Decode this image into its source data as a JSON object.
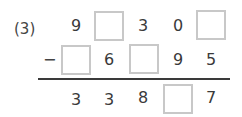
{
  "problem": {
    "label": "(3)",
    "operator": "−",
    "rows": [
      [
        "9",
        "",
        "3",
        "0",
        ""
      ],
      [
        "",
        "6",
        "",
        "9",
        "5"
      ],
      [
        "3",
        "3",
        "8",
        "",
        "7"
      ]
    ],
    "blank_cells": [
      [
        0,
        1
      ],
      [
        0,
        4
      ],
      [
        1,
        0
      ],
      [
        1,
        2
      ],
      [
        2,
        3
      ]
    ]
  }
}
